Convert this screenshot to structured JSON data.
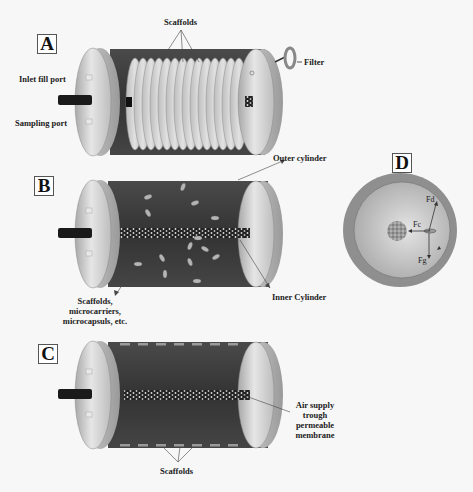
{
  "figure": {
    "panels": [
      {
        "id": "A",
        "letter": "A",
        "labels": {
          "scaffolds": "Scaffolds",
          "inlet_fill_port": "Inlet fill port",
          "sampling_port": "Sampling port",
          "filter": "Filter"
        }
      },
      {
        "id": "B",
        "letter": "B",
        "labels": {
          "outer_cylinder": "Outer cylinder",
          "inner_cylinder": "Inner Cylinder",
          "scaffolds_line1": "Scaffolds,",
          "scaffolds_line2": "microcarriers,",
          "scaffolds_line3": "microcapsuls, etc."
        }
      },
      {
        "id": "C",
        "letter": "C",
        "labels": {
          "air_line1": "Air supply",
          "air_line2": "trough",
          "air_line3": "permeable",
          "air_line4": "membrane",
          "scaffolds": "Scaffolds"
        }
      },
      {
        "id": "D",
        "letter": "D",
        "labels": {
          "fd": "Fd",
          "fc": "Fc",
          "fg": "Fg"
        }
      }
    ],
    "colors": {
      "cylinder_body": "#3a3a3a",
      "end_cap": "#c8c8c8",
      "disc": "#d0d0d0",
      "rotation_disc_outer": "#8a8a8a",
      "rotation_disc_inner": "#c4c4c4"
    }
  }
}
